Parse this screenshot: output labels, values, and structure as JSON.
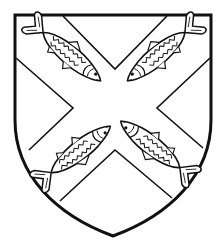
{
  "image": {
    "subject": "Heraldic shield",
    "description": "Argent, a saltire between four fish (herrings/mackerel) in saltire",
    "colors": {
      "field": "#ffffff",
      "outline": "#111111",
      "background": "#ffffff"
    },
    "charges": [
      {
        "name": "fish-top-left",
        "position": "upper-left",
        "head_direction": "toward-center"
      },
      {
        "name": "fish-top-right",
        "position": "upper-right",
        "head_direction": "toward-center"
      },
      {
        "name": "fish-bottom-left",
        "position": "lower-left",
        "head_direction": "toward-center"
      },
      {
        "name": "fish-bottom-right",
        "position": "lower-right",
        "head_direction": "toward-center"
      }
    ],
    "ordinary": "saltire"
  }
}
